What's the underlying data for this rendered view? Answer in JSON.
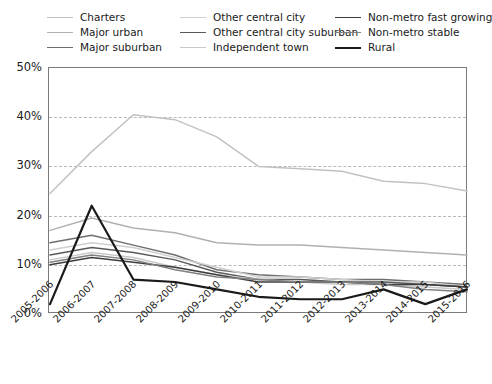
{
  "chart_data": {
    "type": "line",
    "title": "",
    "xlabel": "",
    "ylabel": "",
    "ylim": [
      0,
      50
    ],
    "ytick_labels": [
      "0%",
      "10%",
      "20%",
      "30%",
      "40%",
      "50%"
    ],
    "ytick_values": [
      0,
      10,
      20,
      30,
      40,
      50
    ],
    "grid": true,
    "grid_style": "dashed-horizontal",
    "legend_position": "top",
    "legend_columns": 3,
    "categories": [
      "2005-2006",
      "2006-2007",
      "2007-2008",
      "2008-2009",
      "2009-2010",
      "2010-2011",
      "2011-2012",
      "2012-2013",
      "2013-2014",
      "2014-2015",
      "2015-2016"
    ],
    "series": [
      {
        "name": "Charters",
        "color": "#c2c2c2",
        "width": 1.5,
        "values": [
          24.5,
          33.0,
          40.5,
          39.5,
          36.0,
          30.0,
          29.5,
          29.0,
          27.0,
          26.5,
          25.0
        ]
      },
      {
        "name": "Major urban",
        "color": "#b0b0b0",
        "width": 1.5,
        "values": [
          17.0,
          19.5,
          17.5,
          16.5,
          14.5,
          14.0,
          14.0,
          13.5,
          13.0,
          12.5,
          12.0
        ]
      },
      {
        "name": "Major suburban",
        "color": "#6e6e6e",
        "width": 1.5,
        "values": [
          14.5,
          16.0,
          14.0,
          12.0,
          9.0,
          8.0,
          7.5,
          7.0,
          7.0,
          6.5,
          6.0
        ]
      },
      {
        "name": "Other central city",
        "color": "#cfcfcf",
        "width": 1.5,
        "values": [
          13.0,
          14.5,
          13.5,
          11.5,
          9.5,
          7.5,
          7.5,
          7.0,
          6.5,
          6.5,
          5.5
        ]
      },
      {
        "name": "Other central city suburban",
        "color": "#5a5a5a",
        "width": 1.5,
        "values": [
          12.0,
          13.5,
          12.5,
          11.0,
          8.5,
          7.0,
          7.0,
          6.5,
          6.5,
          6.0,
          5.5
        ]
      },
      {
        "name": "Independent town",
        "color": "#c9c9c9",
        "width": 1.5,
        "values": [
          11.0,
          12.5,
          11.5,
          9.5,
          8.0,
          7.0,
          6.5,
          6.0,
          6.0,
          5.5,
          5.0
        ]
      },
      {
        "name": "Non-metro fast growing",
        "color": "#3d3d3d",
        "width": 1.5,
        "values": [
          10.0,
          11.5,
          10.5,
          9.5,
          8.0,
          6.5,
          6.5,
          6.5,
          6.0,
          6.0,
          5.5
        ]
      },
      {
        "name": "Non-metro stable",
        "color": "#808080",
        "width": 1.5,
        "values": [
          10.5,
          12.0,
          11.0,
          9.0,
          7.5,
          7.0,
          6.5,
          6.5,
          6.0,
          5.0,
          4.5
        ]
      },
      {
        "name": "Rural",
        "color": "#1a1a1a",
        "width": 2.2,
        "values": [
          2.0,
          22.0,
          7.0,
          6.5,
          5.0,
          3.5,
          3.0,
          3.0,
          5.0,
          2.0,
          5.0
        ]
      }
    ]
  },
  "legend": {
    "columns": [
      {
        "items": [
          {
            "label": "Charters",
            "color": "#c2c2c2",
            "width": 1.6
          },
          {
            "label": "Major urban",
            "color": "#b0b0b0",
            "width": 1.6
          },
          {
            "label": "Major suburban",
            "color": "#6e6e6e",
            "width": 1.6
          }
        ]
      },
      {
        "items": [
          {
            "label": "Other central city",
            "color": "#cfcfcf",
            "width": 1.6
          },
          {
            "label": "Other central city suburban",
            "color": "#5a5a5a",
            "width": 1.6
          },
          {
            "label": "Independent town",
            "color": "#c9c9c9",
            "width": 1.6
          }
        ]
      },
      {
        "items": [
          {
            "label": "Non-metro fast growing",
            "color": "#3d3d3d",
            "width": 1.8
          },
          {
            "label": "Non-metro stable",
            "color": "#808080",
            "width": 1.6
          },
          {
            "label": "Rural",
            "color": "#1a1a1a",
            "width": 2.2
          }
        ]
      }
    ]
  }
}
